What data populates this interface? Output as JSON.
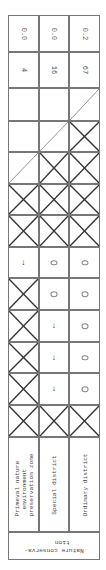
{
  "table": {
    "columns": [
      {
        "key": "primeval",
        "label": "Primeval nature environment preservation zone",
        "label_lines": [
          "Primeval nature",
          "environment",
          "preservation zone"
        ]
      },
      {
        "key": "special",
        "label": "Special district",
        "label_lines": [
          "Special district"
        ]
      },
      {
        "key": "ordinary",
        "label": "Ordinary district",
        "label_lines": [
          "Ordinary district"
        ]
      }
    ],
    "group_label": "Nature conservation",
    "group_label_lines": [
      "Nature conserva-",
      "tion"
    ],
    "rows": [
      [
        "0.0",
        "0.0",
        "0.2"
      ],
      [
        "4",
        "16",
        "67"
      ],
      [
        "",
        "",
        "diag"
      ],
      [
        "",
        "diag",
        "x"
      ],
      [
        "diag",
        "x",
        "x"
      ],
      [
        "x",
        "x",
        "x"
      ],
      [
        "x",
        "x",
        "x"
      ],
      [
        "arrow",
        "zero",
        "zero"
      ],
      [
        "x",
        "zero",
        "zero"
      ],
      [
        "x",
        "arrow",
        "zero"
      ],
      [
        "x",
        "arrow",
        "zero"
      ],
      [
        "x",
        "arrow",
        "zero"
      ],
      [
        "x",
        "x",
        "x"
      ]
    ],
    "symbols": {
      "arrow": "↓",
      "zero": "o"
    }
  }
}
